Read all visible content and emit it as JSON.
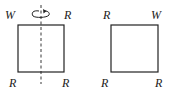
{
  "figure": {
    "left_square": {
      "corners": {
        "top_left": "W",
        "top_right": "R",
        "bottom_left": "R",
        "bottom_right": "R"
      },
      "axis": "dashed-vertical",
      "rotation_arrow": "rotate-icon"
    },
    "right_square": {
      "corners": {
        "top_left": "R",
        "top_right": "W",
        "bottom_left": "R",
        "bottom_right": "R"
      }
    },
    "colors": {
      "stroke": "#222222",
      "background": "#ffffff"
    }
  }
}
